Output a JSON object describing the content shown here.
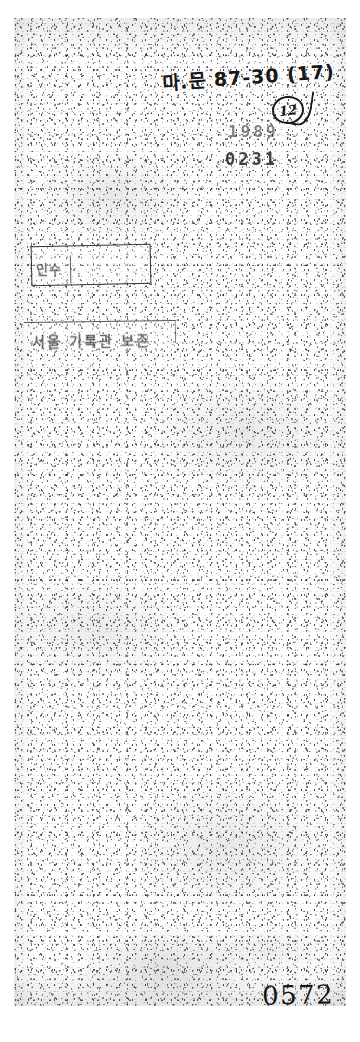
{
  "document": {
    "type": "scanned-archival-page",
    "condition": "heavily degraded, high-noise monochrome scan",
    "page_number": "0572"
  },
  "annotations": {
    "handwritten_reference": "마.문 87-30 (17)",
    "circled_number": "12"
  },
  "stamps": {
    "row_1": "1989",
    "row_2": "0231",
    "upper_box_text": "인수",
    "lower_box_text": "서울 기록관 보존"
  },
  "footer": {
    "page_number": "0572"
  },
  "colors": {
    "paper": "#fefefe",
    "ink": "#1a1a1a",
    "margin": "#ffffff"
  }
}
